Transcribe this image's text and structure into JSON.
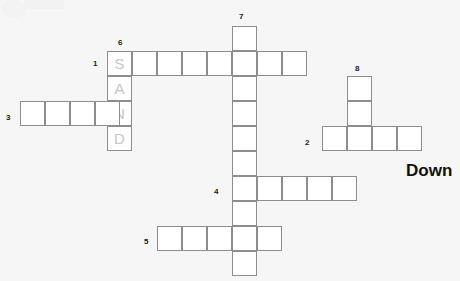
{
  "puzzle": {
    "title": "Crossword Puzzle Grid",
    "cell_size": 25,
    "grid_line_color": "#8d8d8d",
    "cell_fill_color": "#ffffff",
    "background_color": "#f6f6f6",
    "prefilled_text_color": "#c6c6c6",
    "clue_number_color": "#1b1b1b"
  },
  "labels": {
    "down_heading": "Down"
  },
  "clue_numbers": [
    {
      "id": "clue-num-1",
      "label": "1",
      "x": 93,
      "y": 60
    },
    {
      "id": "clue-num-2",
      "label": "2",
      "x": 305,
      "y": 139
    },
    {
      "id": "clue-num-3",
      "label": "3",
      "x": 6,
      "y": 114
    },
    {
      "id": "clue-num-4",
      "label": "4",
      "x": 214,
      "y": 188
    },
    {
      "id": "clue-num-5",
      "label": "5",
      "x": 144,
      "y": 238
    },
    {
      "id": "clue-num-6",
      "label": "6",
      "x": 118,
      "y": 39
    },
    {
      "id": "clue-num-7",
      "label": "7",
      "x": 239,
      "y": 13
    },
    {
      "id": "clue-num-8",
      "label": "8",
      "x": 355,
      "y": 65
    }
  ],
  "cells": [
    {
      "id": "r1c1",
      "x": 107,
      "y": 51,
      "letter": "S",
      "prefilled": true
    },
    {
      "id": "r1c2",
      "x": 132,
      "y": 51,
      "letter": "",
      "prefilled": false
    },
    {
      "id": "r1c3",
      "x": 157,
      "y": 51,
      "letter": "",
      "prefilled": false
    },
    {
      "id": "r1c4",
      "x": 182,
      "y": 51,
      "letter": "",
      "prefilled": false
    },
    {
      "id": "r1c5",
      "x": 207,
      "y": 51,
      "letter": "",
      "prefilled": false
    },
    {
      "id": "r1c6",
      "x": 232,
      "y": 51,
      "letter": "",
      "prefilled": false
    },
    {
      "id": "r1c7",
      "x": 257,
      "y": 51,
      "letter": "",
      "prefilled": false
    },
    {
      "id": "r1c8",
      "x": 282,
      "y": 51,
      "letter": "",
      "prefilled": false
    },
    {
      "id": "c7r0",
      "x": 232,
      "y": 26,
      "letter": "",
      "prefilled": false
    },
    {
      "id": "c7r2",
      "x": 232,
      "y": 76,
      "letter": "",
      "prefilled": false
    },
    {
      "id": "c7r3",
      "x": 232,
      "y": 101,
      "letter": "",
      "prefilled": false
    },
    {
      "id": "c7r4",
      "x": 232,
      "y": 126,
      "letter": "",
      "prefilled": false
    },
    {
      "id": "c7r5",
      "x": 232,
      "y": 151,
      "letter": "",
      "prefilled": false
    },
    {
      "id": "c7r7",
      "x": 232,
      "y": 201,
      "letter": "",
      "prefilled": false
    },
    {
      "id": "c7r9",
      "x": 232,
      "y": 251,
      "letter": "",
      "prefilled": false
    },
    {
      "id": "sand-a",
      "x": 107,
      "y": 76,
      "letter": "A",
      "prefilled": true
    },
    {
      "id": "sand-n",
      "x": 107,
      "y": 101,
      "letter": "N",
      "prefilled": true
    },
    {
      "id": "sand-d",
      "x": 107,
      "y": 126,
      "letter": "D",
      "prefilled": true
    },
    {
      "id": "r3c1",
      "x": 20,
      "y": 101,
      "letter": "",
      "prefilled": false
    },
    {
      "id": "r3c2",
      "x": 45,
      "y": 101,
      "letter": "",
      "prefilled": false
    },
    {
      "id": "r3c3",
      "x": 70,
      "y": 101,
      "letter": "",
      "prefilled": false
    },
    {
      "id": "r3c4",
      "x": 95,
      "y": 101,
      "letter": "",
      "prefilled": false
    },
    {
      "id": "c8r1",
      "x": 347,
      "y": 76,
      "letter": "",
      "prefilled": false
    },
    {
      "id": "c8r2",
      "x": 347,
      "y": 101,
      "letter": "",
      "prefilled": false
    },
    {
      "id": "r2c1",
      "x": 322,
      "y": 126,
      "letter": "",
      "prefilled": false
    },
    {
      "id": "r2c2",
      "x": 347,
      "y": 126,
      "letter": "",
      "prefilled": false
    },
    {
      "id": "r2c3",
      "x": 372,
      "y": 126,
      "letter": "",
      "prefilled": false
    },
    {
      "id": "r2c4",
      "x": 397,
      "y": 126,
      "letter": "",
      "prefilled": false
    },
    {
      "id": "r4c1",
      "x": 232,
      "y": 176,
      "letter": "",
      "prefilled": false
    },
    {
      "id": "r4c2",
      "x": 257,
      "y": 176,
      "letter": "",
      "prefilled": false
    },
    {
      "id": "r4c3",
      "x": 282,
      "y": 176,
      "letter": "",
      "prefilled": false
    },
    {
      "id": "r4c4",
      "x": 307,
      "y": 176,
      "letter": "",
      "prefilled": false
    },
    {
      "id": "r4c5",
      "x": 332,
      "y": 176,
      "letter": "",
      "prefilled": false
    },
    {
      "id": "r5c1",
      "x": 157,
      "y": 226,
      "letter": "",
      "prefilled": false
    },
    {
      "id": "r5c2",
      "x": 182,
      "y": 226,
      "letter": "",
      "prefilled": false
    },
    {
      "id": "r5c3",
      "x": 207,
      "y": 226,
      "letter": "",
      "prefilled": false
    },
    {
      "id": "r5c4",
      "x": 232,
      "y": 226,
      "letter": "",
      "prefilled": false
    },
    {
      "id": "r5c5",
      "x": 257,
      "y": 226,
      "letter": "",
      "prefilled": false
    }
  ],
  "down_label_position": {
    "x": 406,
    "y": 162
  }
}
